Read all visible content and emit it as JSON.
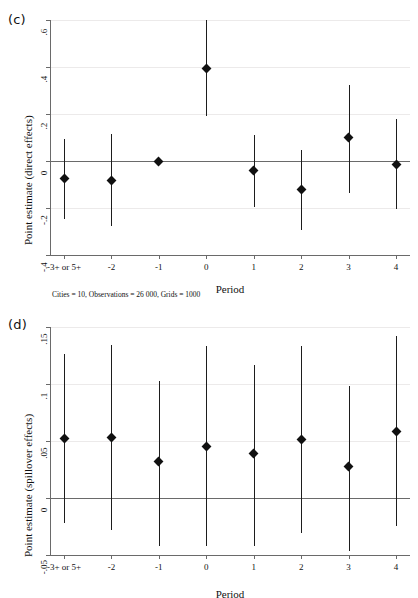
{
  "figure": {
    "panels": [
      {
        "id": "c",
        "label": "(c)",
        "note": "Cities = 10, Observations = 26 000, Grids = 1000",
        "chart_data": {
          "type": "scatter",
          "title": "",
          "subtitle": "",
          "xlabel": "Period",
          "ylabel": "Point estimate (direct effects)",
          "categories": [
            "-3+ or 5+",
            "-2",
            "-1",
            "0",
            "1",
            "2",
            "3",
            "4"
          ],
          "yticks": [
            ".6",
            ".4",
            ".2",
            "0",
            "-.2",
            "-.4"
          ],
          "ytick_values": [
            0.6,
            0.4,
            0.2,
            0,
            -0.2,
            -0.4
          ],
          "ylim": [
            -0.4,
            0.6
          ],
          "grid": true,
          "legend": "none",
          "zero_reference_line": 0,
          "values": [
            -0.075,
            -0.085,
            0.0,
            0.393,
            -0.04,
            -0.12,
            0.1,
            -0.015
          ],
          "ci_low": [
            -0.245,
            -0.275,
            0.0,
            0.19,
            -0.195,
            -0.295,
            -0.135,
            -0.205
          ],
          "ci_high": [
            0.093,
            0.113,
            0.0,
            0.6,
            0.112,
            0.048,
            0.325,
            0.178
          ],
          "annotations": [
            "Cities = 10, Observations = 26 000, Grids = 1000"
          ]
        }
      },
      {
        "id": "d",
        "label": "(d)",
        "note": "",
        "chart_data": {
          "type": "scatter",
          "title": "",
          "subtitle": "",
          "xlabel": "Period",
          "ylabel": "Point estimate (spillover effects)",
          "categories": [
            "-3+ or 5+",
            "-2",
            "-1",
            "0",
            "1",
            "2",
            "3",
            "4"
          ],
          "yticks": [
            ".15",
            ".1",
            ".05",
            "0",
            "-.05"
          ],
          "ytick_values": [
            0.15,
            0.1,
            0.05,
            0,
            -0.05
          ],
          "ylim": [
            -0.05,
            0.15
          ],
          "grid": true,
          "legend": "none",
          "zero_reference_line": 0,
          "values": [
            0.052,
            0.0533,
            0.0318,
            0.0452,
            0.0392,
            0.0512,
            0.0275,
            0.058
          ],
          "ci_low": [
            -0.0222,
            -0.0278,
            -0.0425,
            -0.0418,
            -0.0418,
            -0.031,
            -0.0462,
            -0.0248
          ],
          "ci_high": [
            0.1263,
            0.134,
            0.1028,
            0.133,
            0.1165,
            0.1332,
            0.0985,
            0.1418
          ]
        }
      }
    ]
  }
}
